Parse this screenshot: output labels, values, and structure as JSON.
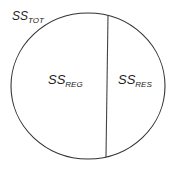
{
  "diagram": {
    "total_label": {
      "main": "SS",
      "sub": "TOT"
    },
    "regression_label": {
      "main": "SS",
      "sub": "REG"
    },
    "residual_label": {
      "main": "SS",
      "sub": "RES"
    },
    "stroke_color": "#333333"
  }
}
